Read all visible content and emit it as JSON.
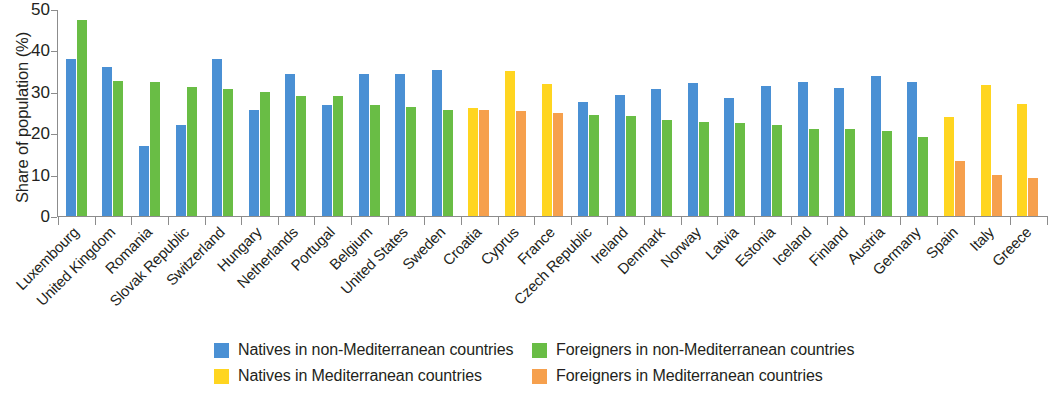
{
  "chart_data": {
    "type": "bar",
    "title": "",
    "xlabel": "",
    "ylabel": "Share of population (%)",
    "ylim": [
      0,
      50
    ],
    "yticks": [
      0,
      10,
      20,
      30,
      40,
      50
    ],
    "grid": false,
    "legend_position": "bottom",
    "categories": [
      "Luxembourg",
      "United Kingdom",
      "Romania",
      "Slovak Republic",
      "Switzerland",
      "Hungary",
      "Netherlands",
      "Portugal",
      "Belgium",
      "United States",
      "Sweden",
      "Croatia",
      "Cyprus",
      "France",
      "Czech Republic",
      "Ireland",
      "Denmark",
      "Norway",
      "Latvia",
      "Estonia",
      "Iceland",
      "Finland",
      "Austria",
      "Germany",
      "Spain",
      "Italy",
      "Greece"
    ],
    "series": [
      {
        "name": "Natives in non-Mediterranean countries",
        "color": "#4a90d4",
        "values": [
          38.0,
          36.0,
          17.0,
          22.0,
          38.0,
          25.6,
          34.2,
          26.9,
          34.4,
          34.3,
          35.3,
          null,
          null,
          null,
          27.6,
          29.3,
          30.7,
          32.2,
          28.4,
          31.3,
          32.3,
          31.0,
          33.9,
          32.4,
          null,
          null,
          null
        ]
      },
      {
        "name": "Foreigners in non-Mediterranean countries",
        "color": "#69bd45",
        "values": [
          47.3,
          32.5,
          32.4,
          31.1,
          30.7,
          30.0,
          29.1,
          28.9,
          26.9,
          26.4,
          25.6,
          null,
          null,
          null,
          24.5,
          24.1,
          23.3,
          22.8,
          22.5,
          21.9,
          21.0,
          20.9,
          20.5,
          19.2,
          null,
          null,
          null
        ]
      },
      {
        "name": "Natives in Mediterranean countries",
        "color": "#ffd520",
        "values": [
          null,
          null,
          null,
          null,
          null,
          null,
          null,
          null,
          null,
          null,
          null,
          26.1,
          35.0,
          32.0,
          null,
          null,
          null,
          null,
          null,
          null,
          null,
          null,
          null,
          null,
          24.0,
          31.6,
          27.0
        ]
      },
      {
        "name": "Foreigners in Mediterranean countries",
        "color": "#f6a04d",
        "values": [
          null,
          null,
          null,
          null,
          null,
          null,
          null,
          null,
          null,
          null,
          null,
          25.5,
          25.3,
          24.9,
          null,
          null,
          null,
          null,
          null,
          null,
          null,
          null,
          null,
          null,
          13.3,
          10.0,
          9.3
        ]
      }
    ]
  },
  "legend": {
    "items": [
      {
        "label": "Natives in non-Mediterranean countries",
        "color_key": "blue"
      },
      {
        "label": "Foreigners in non-Mediterranean countries",
        "color_key": "green"
      },
      {
        "label": "Natives in Mediterranean countries",
        "color_key": "yellow"
      },
      {
        "label": "Foreigners in Mediterranean countries",
        "color_key": "orange"
      }
    ]
  },
  "colors": {
    "blue": "#4a90d4",
    "green": "#69bd45",
    "yellow": "#ffd520",
    "orange": "#f6a04d",
    "axis": "#8c8c8c",
    "text": "#231f20"
  }
}
